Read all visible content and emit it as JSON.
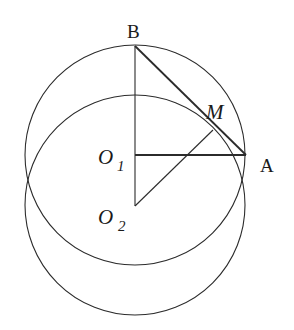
{
  "figure": {
    "type": "geometry",
    "stroke_color": "#2b2b2b",
    "background": "#ffffff",
    "circles": [
      {
        "name": "circle-o1",
        "center": "O1",
        "cx": 135,
        "cy": 155,
        "r": 110
      },
      {
        "name": "circle-o2",
        "center": "O2",
        "cx": 135,
        "cy": 205,
        "r": 110
      }
    ],
    "points": {
      "B": {
        "x": 135,
        "y": 46
      },
      "A": {
        "x": 246,
        "y": 155
      },
      "M": {
        "x": 213,
        "y": 130
      },
      "O1": {
        "x": 135,
        "y": 155
      },
      "O2": {
        "x": 135,
        "y": 206
      }
    },
    "segments": [
      {
        "name": "segment-b-o2",
        "from": "B",
        "to": "O2"
      },
      {
        "name": "segment-b-a",
        "from": "B",
        "to": "A"
      },
      {
        "name": "segment-o1-a",
        "from": "O1",
        "to": "A"
      },
      {
        "name": "segment-o2-m",
        "from": "O2",
        "to": "M"
      }
    ],
    "labels": {
      "B": "B",
      "A": "A",
      "M": "M",
      "O1_main": "O",
      "O1_sub": "1",
      "O2_main": "O",
      "O2_sub": "2"
    }
  }
}
